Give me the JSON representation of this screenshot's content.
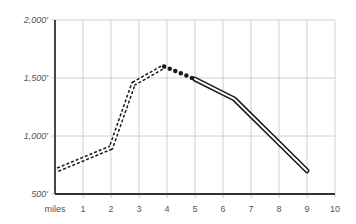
{
  "chart_data": {
    "type": "line",
    "title": "",
    "xlabel": "miles",
    "ylabel": "",
    "xlim": [
      0,
      10
    ],
    "ylim": [
      500,
      2000
    ],
    "grid": true,
    "x_ticks": [
      "miles",
      "1",
      "2",
      "3",
      "4",
      "5",
      "6",
      "7",
      "8",
      "9",
      "10"
    ],
    "y_ticks": [
      "500'",
      "1,000'",
      "1,500'",
      "2,000'"
    ],
    "series": [
      {
        "name": "segment-dashed-double",
        "style": "double dashed",
        "x": [
          0.1,
          2.0,
          2.8,
          3.9
        ],
        "y": [
          710,
          900,
          1450,
          1600
        ]
      },
      {
        "name": "segment-dotted-bold",
        "style": "bold dotted",
        "x": [
          3.9,
          5.0
        ],
        "y": [
          1600,
          1490
        ]
      },
      {
        "name": "segment-solid-double",
        "style": "double solid",
        "x": [
          5.0,
          6.4,
          9.0
        ],
        "y": [
          1490,
          1320,
          700
        ]
      }
    ],
    "colors": {
      "line": "#1a1a1a",
      "grid": "#d0d0d0",
      "axis": "#333333",
      "label": "#555555"
    }
  }
}
